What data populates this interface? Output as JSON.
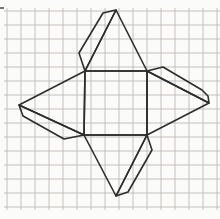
{
  "figure": {
    "canvas": {
      "width": 220,
      "height": 219,
      "paper_color": "#fbfbf9"
    },
    "grid": {
      "spacing": 14,
      "x_first": 7,
      "x_last": 217,
      "y_first": 11,
      "y_last": 207,
      "overhang": 3,
      "color": "#b7b5b1",
      "line_width": 0.8
    },
    "outline": {
      "color": "#2d2d2d",
      "line_width": 1.6
    },
    "shapes": [
      {
        "name": "square-base",
        "points": [
          [
            85,
            71
          ],
          [
            147,
            71
          ],
          [
            147,
            135
          ],
          [
            84,
            135
          ]
        ]
      },
      {
        "name": "triangle-top",
        "points": [
          [
            85,
            71
          ],
          [
            116,
            10
          ],
          [
            147,
            71
          ]
        ]
      },
      {
        "name": "triangle-right",
        "points": [
          [
            147,
            71
          ],
          [
            209,
            103
          ],
          [
            147,
            135
          ]
        ]
      },
      {
        "name": "triangle-bottom",
        "points": [
          [
            84,
            135
          ],
          [
            116,
            196
          ],
          [
            147,
            135
          ]
        ]
      },
      {
        "name": "triangle-left",
        "points": [
          [
            85,
            71
          ],
          [
            19,
            105
          ],
          [
            84,
            135
          ]
        ]
      },
      {
        "name": "flap-top",
        "points": [
          [
            116,
            10
          ],
          [
            103,
            13
          ],
          [
            79,
            53
          ],
          [
            85,
            71
          ]
        ]
      },
      {
        "name": "flap-right",
        "points": [
          [
            147,
            71
          ],
          [
            163,
            67
          ],
          [
            202,
            90
          ],
          [
            208,
            96
          ],
          [
            209,
            103
          ]
        ]
      },
      {
        "name": "flap-bottom",
        "points": [
          [
            147,
            135
          ],
          [
            152,
            150
          ],
          [
            128,
            192
          ],
          [
            116,
            196
          ]
        ]
      },
      {
        "name": "flap-left",
        "points": [
          [
            19,
            105
          ],
          [
            23,
            116
          ],
          [
            64,
            139
          ],
          [
            84,
            135
          ]
        ]
      }
    ],
    "artifact": {
      "x1": 0,
      "y1": 8,
      "x2": 4,
      "y2": 8,
      "color": "#4a4a4a",
      "line_width": 1.5
    }
  }
}
